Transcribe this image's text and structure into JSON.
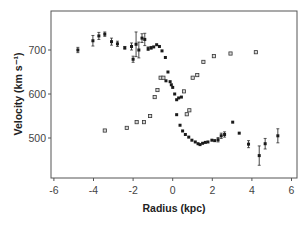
{
  "chart_data": {
    "type": "scatter",
    "title": "",
    "xlabel": "Radius (kpc)",
    "ylabel": "Velocity (km s⁻¹)",
    "xlim": [
      -6.3,
      6.3
    ],
    "ylim": [
      415,
      780
    ],
    "xticks": [
      -6,
      -4,
      -2,
      0,
      2,
      4,
      6
    ],
    "yticks": [
      500,
      600,
      700
    ],
    "grid": false,
    "legend": null,
    "series": [
      {
        "name": "rotation-curve-filled",
        "marker": "filled-square",
        "color": "#1a1a1a",
        "points": [
          {
            "x": -4.79,
            "y": 700,
            "err": 6
          },
          {
            "x": -4.03,
            "y": 721,
            "err": 12
          },
          {
            "x": -3.73,
            "y": 732,
            "err": 8
          },
          {
            "x": -3.43,
            "y": 736,
            "err": 5
          },
          {
            "x": -3.09,
            "y": 719,
            "err": 8
          },
          {
            "x": -2.79,
            "y": 714,
            "err": 6
          },
          {
            "x": -2.42,
            "y": 705,
            "err": 3
          },
          {
            "x": -2.08,
            "y": 708,
            "err": 8
          },
          {
            "x": -2.0,
            "y": 679,
            "err": 7
          },
          {
            "x": -1.85,
            "y": 713,
            "err": 28
          },
          {
            "x": -1.71,
            "y": 700,
            "err": 18
          },
          {
            "x": -1.55,
            "y": 727,
            "err": 10
          },
          {
            "x": -1.41,
            "y": 724,
            "err": 14
          },
          {
            "x": -1.24,
            "y": 703,
            "err": 4
          },
          {
            "x": -1.09,
            "y": 705,
            "err": 3
          },
          {
            "x": -0.96,
            "y": 707,
            "err": 0
          },
          {
            "x": -0.81,
            "y": 712,
            "err": 0
          },
          {
            "x": -0.67,
            "y": 708,
            "err": 0
          },
          {
            "x": -0.54,
            "y": 698,
            "err": 0
          },
          {
            "x": -0.37,
            "y": 683,
            "err": 0
          },
          {
            "x": -0.24,
            "y": 650,
            "err": 0
          },
          {
            "x": -0.34,
            "y": 630,
            "err": 0
          },
          {
            "x": -0.13,
            "y": 628,
            "err": 0
          },
          {
            "x": -0.07,
            "y": 621,
            "err": 0
          },
          {
            "x": 0.0,
            "y": 615,
            "err": 0
          },
          {
            "x": 0.1,
            "y": 600,
            "err": 0
          },
          {
            "x": 0.2,
            "y": 587,
            "err": 0
          },
          {
            "x": 0.3,
            "y": 591,
            "err": 0
          },
          {
            "x": 0.44,
            "y": 593,
            "err": 0
          },
          {
            "x": 0.2,
            "y": 553,
            "err": 0
          },
          {
            "x": 0.37,
            "y": 529,
            "err": 0
          },
          {
            "x": 0.5,
            "y": 516,
            "err": 0
          },
          {
            "x": 0.64,
            "y": 508,
            "err": 0
          },
          {
            "x": 0.81,
            "y": 502,
            "err": 0
          },
          {
            "x": 0.97,
            "y": 495,
            "err": 0
          },
          {
            "x": 1.14,
            "y": 491,
            "err": 0
          },
          {
            "x": 1.28,
            "y": 487,
            "err": 0
          },
          {
            "x": 1.38,
            "y": 485,
            "err": 0
          },
          {
            "x": 1.51,
            "y": 488,
            "err": 0
          },
          {
            "x": 1.65,
            "y": 490,
            "err": 0
          },
          {
            "x": 1.78,
            "y": 491,
            "err": 0
          },
          {
            "x": 1.98,
            "y": 495,
            "err": 0
          },
          {
            "x": 2.12,
            "y": 494,
            "err": 0
          },
          {
            "x": 2.29,
            "y": 496,
            "err": 5
          },
          {
            "x": 2.45,
            "y": 505,
            "err": 6
          },
          {
            "x": 2.62,
            "y": 508,
            "err": 6
          },
          {
            "x": 3.03,
            "y": 536,
            "err": 0
          },
          {
            "x": 3.36,
            "y": 511,
            "err": 0
          },
          {
            "x": 3.83,
            "y": 486,
            "err": 8
          },
          {
            "x": 4.37,
            "y": 460,
            "err": 22
          },
          {
            "x": 4.67,
            "y": 487,
            "err": 12
          },
          {
            "x": 5.31,
            "y": 505,
            "err": 16
          }
        ]
      },
      {
        "name": "rotation-curve-open",
        "marker": "open-square",
        "color": "#333333",
        "points": [
          {
            "x": -3.43,
            "y": 517
          },
          {
            "x": -2.32,
            "y": 523
          },
          {
            "x": -1.82,
            "y": 536
          },
          {
            "x": -1.45,
            "y": 536
          },
          {
            "x": -1.14,
            "y": 550
          },
          {
            "x": -0.91,
            "y": 593
          },
          {
            "x": -0.77,
            "y": 609
          },
          {
            "x": -0.61,
            "y": 637
          },
          {
            "x": -0.47,
            "y": 637
          },
          {
            "x": 0.57,
            "y": 606
          },
          {
            "x": 0.71,
            "y": 554
          },
          {
            "x": 0.84,
            "y": 563
          },
          {
            "x": 1.01,
            "y": 637
          },
          {
            "x": 1.24,
            "y": 643
          },
          {
            "x": 1.55,
            "y": 673
          },
          {
            "x": 2.08,
            "y": 686
          },
          {
            "x": 2.92,
            "y": 692
          },
          {
            "x": 4.2,
            "y": 695
          }
        ]
      }
    ]
  },
  "layout": {
    "plot": {
      "left": 51,
      "top": 11,
      "right": 297,
      "bottom": 178
    },
    "x0_px": 172.7,
    "px_per_x": 19.8,
    "y0_val": 700,
    "y0_px": 50,
    "px_per_y": 0.44
  },
  "colors": {
    "axis": "#555555",
    "marker": "#1a1a1a",
    "open_marker_fill": "#d8d8d8",
    "tick_text": "#444444"
  }
}
